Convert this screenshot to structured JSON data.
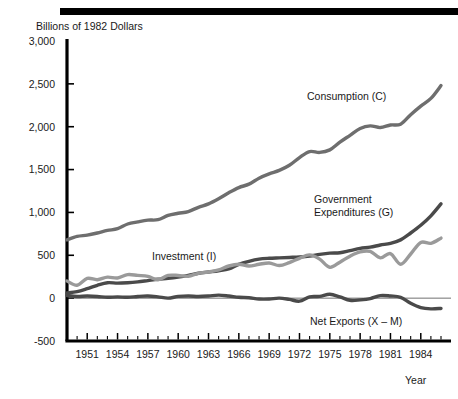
{
  "chart_data": {
    "type": "line",
    "title": "",
    "ylabel": "Billions of 1982 Dollars",
    "xlabel": "Year",
    "ylim": [
      -500,
      3000
    ],
    "xlim": [
      1949,
      1986
    ],
    "ytick_labels": [
      "3,000",
      "2,500",
      "2,000",
      "1,500",
      "1,000",
      "500",
      "0",
      "-500"
    ],
    "ytick_values": [
      3000,
      2500,
      2000,
      1500,
      1000,
      500,
      0,
      -500
    ],
    "xtick_labels": [
      "1951",
      "1954",
      "1957",
      "1960",
      "1963",
      "1966",
      "1969",
      "1972",
      "1975",
      "1978",
      "1981",
      "1984"
    ],
    "xtick_values": [
      1951,
      1954,
      1957,
      1960,
      1963,
      1966,
      1969,
      1972,
      1975,
      1978,
      1981,
      1984
    ],
    "minor_xticks_every": 1,
    "grid": false,
    "legend_position": "inline-annotations",
    "zero_reference_line": true,
    "x": [
      1949,
      1950,
      1951,
      1952,
      1953,
      1954,
      1955,
      1956,
      1957,
      1958,
      1959,
      1960,
      1961,
      1962,
      1963,
      1964,
      1965,
      1966,
      1967,
      1968,
      1969,
      1970,
      1971,
      1972,
      1973,
      1974,
      1975,
      1976,
      1977,
      1978,
      1979,
      1980,
      1981,
      1982,
      1983,
      1984,
      1985,
      1986
    ],
    "series": [
      {
        "name": "Consumption (C)",
        "label": "Consumption (C)",
        "color": "#6e6e6e",
        "width": 3.4,
        "values": [
          680,
          720,
          735,
          760,
          790,
          810,
          865,
          890,
          910,
          915,
          965,
          990,
          1010,
          1060,
          1100,
          1160,
          1230,
          1290,
          1330,
          1400,
          1450,
          1490,
          1550,
          1640,
          1710,
          1700,
          1730,
          1820,
          1900,
          1980,
          2010,
          1990,
          2020,
          2030,
          2140,
          2240,
          2330,
          2480
        ]
      },
      {
        "name": "Government Expenditures (G)",
        "label": "Government\nExpenditures (G)",
        "label_line1": "Government",
        "label_line2": "Expenditures (G)",
        "color": "#4a4a4a",
        "width": 3.4,
        "values": [
          60,
          75,
          110,
          150,
          180,
          175,
          180,
          190,
          205,
          220,
          230,
          245,
          265,
          290,
          305,
          320,
          340,
          395,
          430,
          455,
          465,
          470,
          475,
          480,
          490,
          510,
          525,
          530,
          555,
          580,
          595,
          620,
          640,
          680,
          760,
          850,
          960,
          1100
        ]
      },
      {
        "name": "Investment (I)",
        "label": "Investment (I)",
        "color": "#9a9a9a",
        "width": 3.4,
        "values": [
          200,
          150,
          230,
          215,
          245,
          235,
          275,
          265,
          255,
          215,
          265,
          265,
          255,
          290,
          305,
          330,
          375,
          395,
          375,
          395,
          410,
          380,
          415,
          465,
          505,
          455,
          360,
          420,
          490,
          540,
          545,
          470,
          520,
          395,
          515,
          650,
          640,
          700
        ]
      },
      {
        "name": "Net Exports (X – M)",
        "label": "Net Exports (X – M)",
        "color": "#4a4a4a",
        "width": 3.4,
        "values": [
          30,
          20,
          25,
          20,
          10,
          15,
          10,
          20,
          25,
          15,
          0,
          20,
          25,
          20,
          25,
          35,
          25,
          10,
          5,
          -10,
          -10,
          0,
          -15,
          -35,
          15,
          20,
          45,
          15,
          -25,
          -20,
          -5,
          30,
          25,
          10,
          -60,
          -110,
          -125,
          -120
        ]
      }
    ],
    "annotations": [
      {
        "name": "consumption-label",
        "text": "Consumption (C)",
        "x": 307,
        "y": 100
      },
      {
        "name": "government-label-line1",
        "text": "Government",
        "x": 314,
        "y": 203
      },
      {
        "name": "government-label-line2",
        "text": "Expenditures (G)",
        "x": 314,
        "y": 216
      },
      {
        "name": "investment-label",
        "text": "Investment (I)",
        "x": 152,
        "y": 260
      },
      {
        "name": "net-exports-label",
        "text": "Net Exports (X – M)",
        "x": 310,
        "y": 325
      }
    ]
  }
}
